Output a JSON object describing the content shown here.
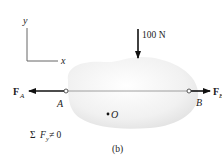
{
  "figure": {
    "caption": "(b)",
    "axes": {
      "x_label": "x",
      "y_label": "y"
    },
    "applied_force": {
      "label": "100 N",
      "direction": "down"
    },
    "points": {
      "A": {
        "label": "A"
      },
      "B": {
        "label": "B"
      },
      "O": {
        "label": "O"
      }
    },
    "forces": {
      "FA": {
        "symbol": "F",
        "subscript": "A",
        "direction": "left"
      },
      "FB": {
        "symbol": "F",
        "subscript": "B",
        "direction": "right"
      }
    },
    "equation": {
      "lhs": "Σ",
      "var": "F",
      "sub": "y",
      "rhs": " ≠ 0"
    }
  },
  "colors": {
    "body_fill": "#ececec",
    "line": "#222222",
    "axis": "#555555"
  }
}
